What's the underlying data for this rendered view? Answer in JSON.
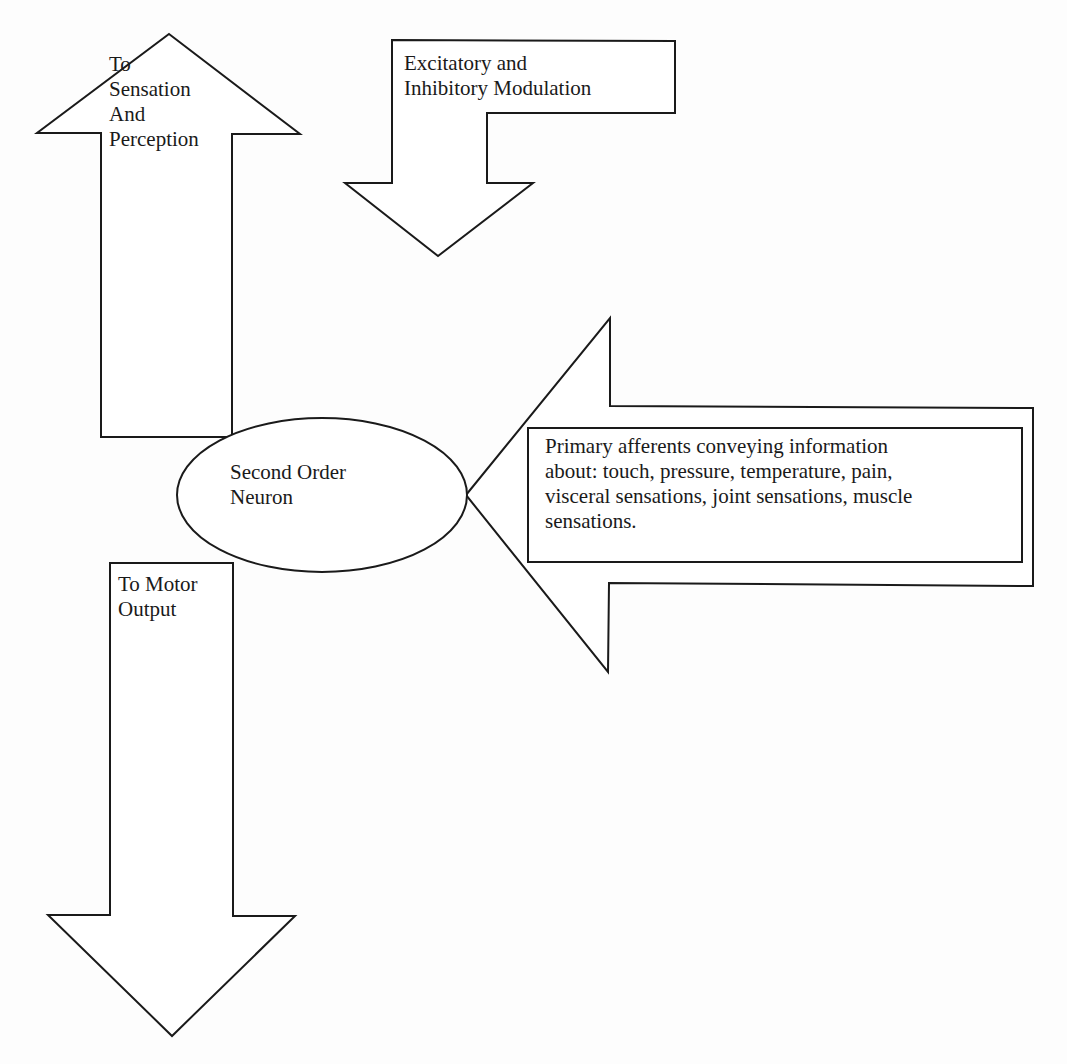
{
  "diagram": {
    "sensation_arrow": {
      "label": "To\nSensation\nAnd\nPerception",
      "direction": "up"
    },
    "modulation_arrow": {
      "label": "Excitatory and\nInhibitory Modulation",
      "direction": "down"
    },
    "neuron": {
      "label": "Second Order\nNeuron",
      "shape": "ellipse"
    },
    "motor_arrow": {
      "label": "To Motor\nOutput",
      "direction": "down"
    },
    "afferent_arrow": {
      "label": "Primary afferents conveying information\nabout: touch, pressure, temperature, pain,\nvisceral sensations, joint sensations, muscle\nsensations.",
      "direction": "left"
    }
  },
  "colors": {
    "stroke": "#1a1a1a",
    "fill": "#ffffff",
    "background": "#fdfdfd"
  }
}
